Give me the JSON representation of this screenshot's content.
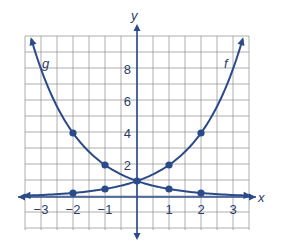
{
  "chart_data": {
    "type": "line",
    "title": "",
    "xlabel": "x",
    "ylabel": "y",
    "xlim": [
      -3.5,
      3.5
    ],
    "ylim": [
      -2,
      10
    ],
    "grid": true,
    "x_ticks": [
      -3,
      -2,
      -1,
      1,
      2,
      3
    ],
    "x_tick_labels": [
      "−3",
      "−2",
      "−1",
      "1",
      "2",
      "3"
    ],
    "y_ticks": [
      2,
      4,
      6,
      8
    ],
    "y_tick_labels": [
      "2",
      "4",
      "6",
      "8"
    ],
    "series": [
      {
        "name": "f",
        "function": "2^x",
        "points": [
          [
            0,
            1
          ],
          [
            1,
            2
          ],
          [
            2,
            4
          ]
        ],
        "marked_points": [
          [
            -2,
            0.25
          ],
          [
            -1,
            0.5
          ],
          [
            0,
            1
          ],
          [
            1,
            2
          ],
          [
            2,
            4
          ]
        ]
      },
      {
        "name": "g",
        "function": "(1/2)^x",
        "points": [
          [
            -2,
            4
          ],
          [
            -1,
            2
          ],
          [
            0,
            1
          ]
        ],
        "marked_points": [
          [
            -2,
            4
          ],
          [
            -1,
            2
          ],
          [
            0,
            1
          ],
          [
            1,
            0.5
          ],
          [
            2,
            0.25
          ]
        ]
      }
    ],
    "legend": "curve labels placed inline: g at upper-left, f at upper-right",
    "colors": {
      "curve": "#2a4a8a",
      "grid": "#9a9a9a",
      "axis": "#2a4a8a"
    }
  },
  "labels": {
    "x_axis": "x",
    "y_axis": "y",
    "curve_f": "f",
    "curve_g": "g"
  }
}
